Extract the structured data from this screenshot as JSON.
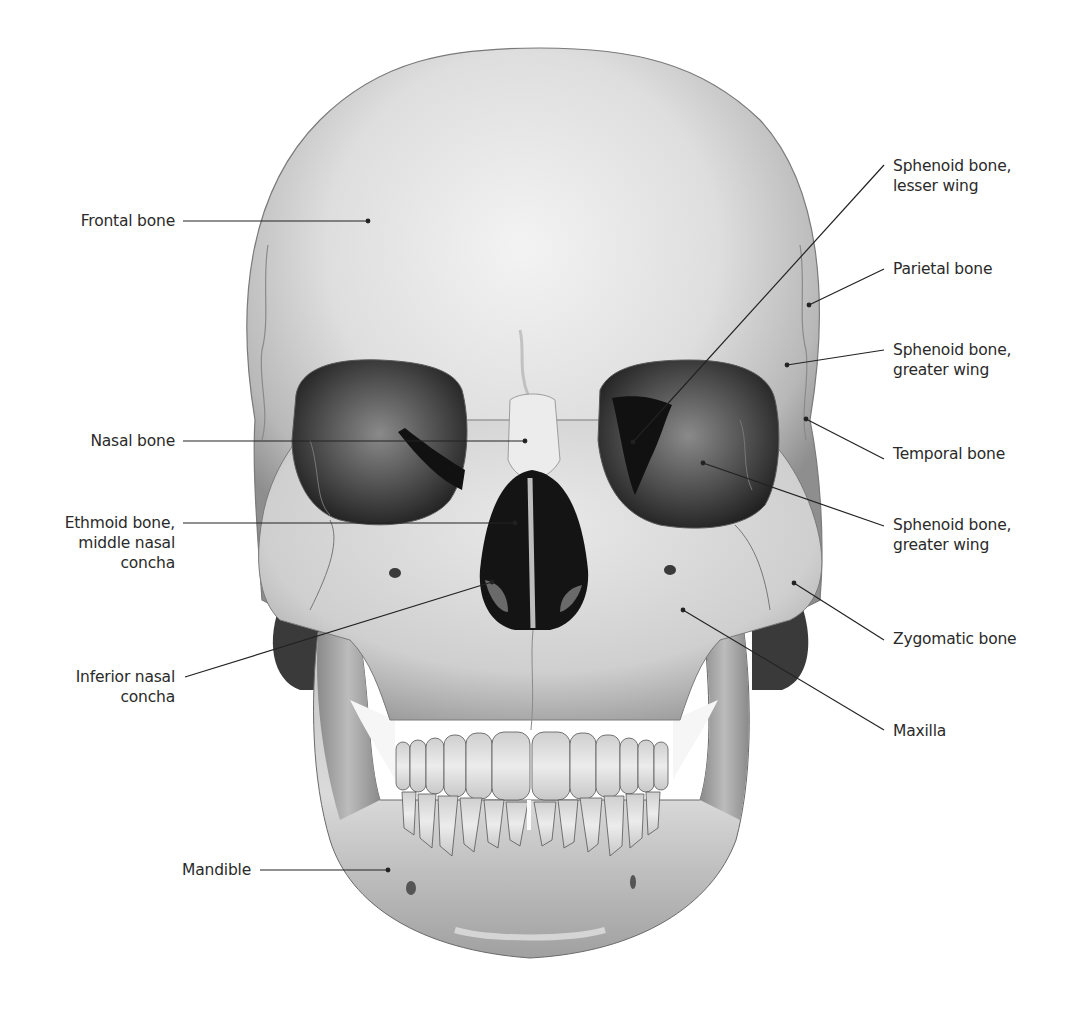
{
  "figure": {
    "colors": {
      "background": "#ffffff",
      "bone_light": "#e8e8e8",
      "bone_mid": "#bdbdbd",
      "bone_dark": "#7a7a7a",
      "cavity": "#1a1a1a",
      "leader_line": "#222222",
      "label_text": "#2a2a2a"
    }
  },
  "labels": {
    "left": [
      {
        "id": "frontal",
        "lines": [
          "Frontal bone"
        ],
        "text_x": 175,
        "text_y": 211,
        "line_from": [
          183,
          221
        ],
        "line_to": [
          368,
          221
        ]
      },
      {
        "id": "nasal",
        "lines": [
          "Nasal bone"
        ],
        "text_x": 175,
        "text_y": 431,
        "line_from": [
          183,
          441
        ],
        "line_to": [
          525,
          441
        ]
      },
      {
        "id": "ethmoid",
        "lines": [
          "Ethmoid bone,",
          "middle nasal",
          "concha"
        ],
        "text_x": 175,
        "text_y": 513,
        "line_from": [
          183,
          523
        ],
        "line_to": [
          515,
          523
        ]
      },
      {
        "id": "inferior-concha",
        "lines": [
          "Inferior nasal",
          "concha"
        ],
        "text_x": 175,
        "text_y": 669,
        "line_from": [
          185,
          677
        ],
        "line_to": [
          492,
          582
        ]
      },
      {
        "id": "mandible",
        "lines": [
          "Mandible"
        ],
        "text_x": 251,
        "text_y": 861,
        "line_from": [
          260,
          870
        ],
        "line_to": [
          388,
          870
        ]
      }
    ],
    "right": [
      {
        "id": "sphenoid-lesser",
        "lines": [
          "Sphenoid bone,",
          "lesser wing"
        ],
        "text_x": 893,
        "text_y": 158,
        "line_from": [
          884,
          165
        ],
        "line_to": [
          633,
          442
        ]
      },
      {
        "id": "parietal",
        "lines": [
          "Parietal bone"
        ],
        "text_x": 893,
        "text_y": 259,
        "line_from": [
          884,
          269
        ],
        "line_to": [
          809,
          305
        ]
      },
      {
        "id": "sphenoid-greater-1",
        "lines": [
          "Sphenoid bone,",
          "greater wing"
        ],
        "text_x": 893,
        "text_y": 342,
        "line_from": [
          884,
          350
        ],
        "line_to": [
          787,
          365
        ]
      },
      {
        "id": "temporal",
        "lines": [
          "Temporal bone"
        ],
        "text_x": 893,
        "text_y": 444,
        "line_from": [
          884,
          459
        ],
        "line_to": [
          806,
          419
        ]
      },
      {
        "id": "sphenoid-greater-2",
        "lines": [
          "Sphenoid bone,",
          "greater wing"
        ],
        "text_x": 893,
        "text_y": 517,
        "line_from": [
          884,
          526
        ],
        "line_to": [
          703,
          463
        ]
      },
      {
        "id": "zygomatic",
        "lines": [
          "Zygomatic bone"
        ],
        "text_x": 893,
        "text_y": 629,
        "line_from": [
          884,
          640
        ],
        "line_to": [
          794,
          583
        ]
      },
      {
        "id": "maxilla",
        "lines": [
          "Maxilla"
        ],
        "text_x": 893,
        "text_y": 722,
        "line_from": [
          884,
          730
        ],
        "line_to": [
          683,
          610
        ]
      }
    ]
  }
}
